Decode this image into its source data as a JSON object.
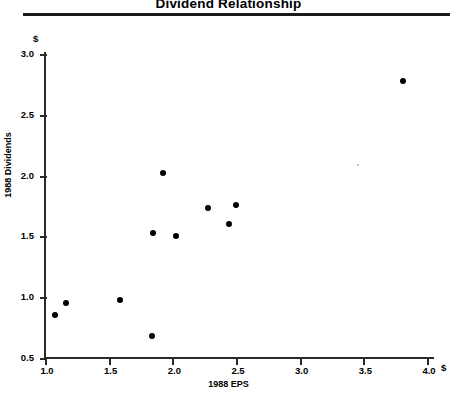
{
  "title": "Dividend Relationship",
  "axes": {
    "x_unit": "$",
    "y_unit": "$",
    "x_title": "1988 EPS",
    "y_title": "1988 Dividends"
  },
  "chart_data": {
    "type": "scatter",
    "title": "Dividend Relationship",
    "xlabel": "1988 EPS",
    "ylabel": "1988 Dividends",
    "x_unit": "$",
    "y_unit": "$",
    "xlim": [
      1.0,
      4.0
    ],
    "ylim": [
      0.5,
      3.0
    ],
    "xticks": [
      "1.0",
      "1.5",
      "2.0",
      "2.5",
      "3.0",
      "3.5",
      "4.0"
    ],
    "yticks": [
      "0.5",
      "1.0",
      "1.5",
      "2.0",
      "2.5",
      "3.0"
    ],
    "grid": false,
    "legend": false,
    "marker": "filled-circle",
    "marker_color": "#000000",
    "points": [
      {
        "x": 1.07,
        "y": 0.85
      },
      {
        "x": 1.16,
        "y": 0.95
      },
      {
        "x": 1.58,
        "y": 0.98
      },
      {
        "x": 1.83,
        "y": 0.68
      },
      {
        "x": 1.84,
        "y": 1.53
      },
      {
        "x": 1.92,
        "y": 2.02
      },
      {
        "x": 2.02,
        "y": 1.5
      },
      {
        "x": 2.27,
        "y": 1.73
      },
      {
        "x": 2.44,
        "y": 1.6
      },
      {
        "x": 2.49,
        "y": 1.76
      },
      {
        "x": 3.8,
        "y": 2.78
      }
    ]
  }
}
